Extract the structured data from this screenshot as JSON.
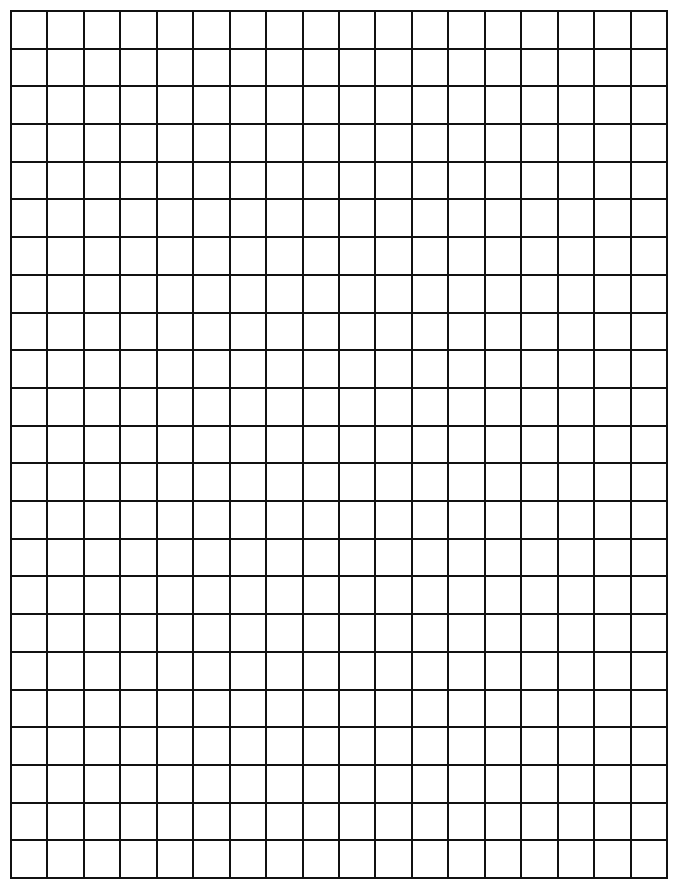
{
  "document": {
    "type": "graph-paper",
    "grid": {
      "columns": 18,
      "rows": 23,
      "line_color": "#111111",
      "background_color": "#ffffff"
    }
  }
}
